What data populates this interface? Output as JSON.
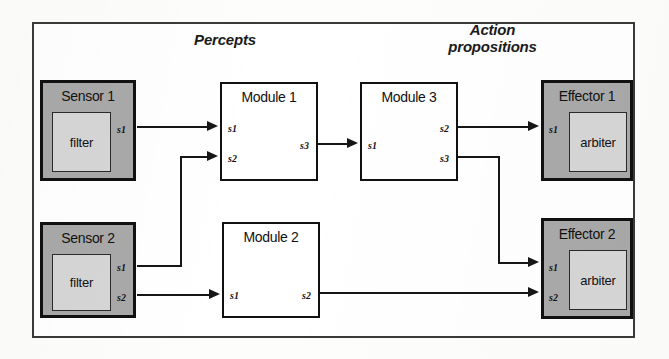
{
  "diagram": {
    "headings": {
      "percepts": "Percepts",
      "action_propositions": "Action\npropositions"
    },
    "colors": {
      "shaded_fill": "#a9a9a9",
      "subbox_fill": "#d6d6d6",
      "line": "#161616",
      "frame": "#3a3a3a",
      "page": "#ffffff"
    },
    "nodes": {
      "sensor1": {
        "title": "Sensor 1",
        "sub_label": "filter",
        "ports_out": [
          "s1"
        ]
      },
      "sensor2": {
        "title": "Sensor 2",
        "sub_label": "filter",
        "ports_out": [
          "s1",
          "s2"
        ]
      },
      "module1": {
        "title": "Module 1",
        "ports_in": [
          "s1",
          "s2"
        ],
        "ports_out": [
          "s3"
        ]
      },
      "module2": {
        "title": "Module 2",
        "ports_in": [
          "s1"
        ],
        "ports_out": [
          "s2"
        ]
      },
      "module3": {
        "title": "Module 3",
        "ports_in": [
          "s1"
        ],
        "ports_out": [
          "s2",
          "s3"
        ]
      },
      "effector1": {
        "title": "Effector 1",
        "sub_label": "arbiter",
        "ports_in": [
          "s1"
        ]
      },
      "effector2": {
        "title": "Effector 2",
        "sub_label": "arbiter",
        "ports_in": [
          "s1",
          "s2"
        ]
      }
    },
    "connections": [
      {
        "from": "sensor1.s1",
        "to": "module1.s1"
      },
      {
        "from": "sensor2.s1",
        "to": "module1.s2"
      },
      {
        "from": "sensor2.s2",
        "to": "module2.s1"
      },
      {
        "from": "module1.s3",
        "to": "module3.s1"
      },
      {
        "from": "module3.s2",
        "to": "effector1.s1"
      },
      {
        "from": "module3.s3",
        "to": "effector2.s1"
      },
      {
        "from": "module2.s2",
        "to": "effector2.s2"
      }
    ]
  }
}
